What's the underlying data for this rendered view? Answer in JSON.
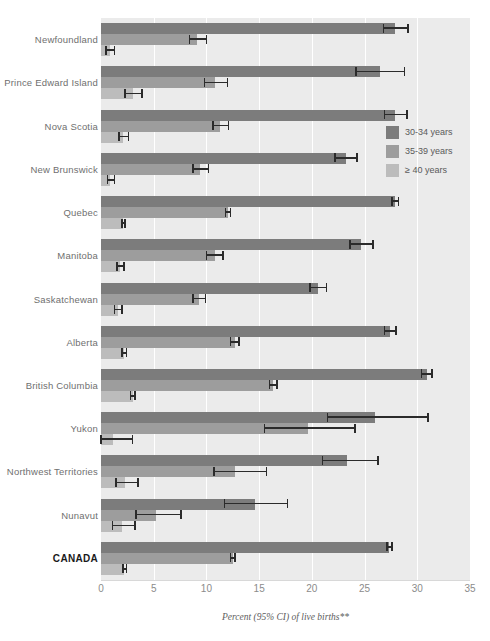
{
  "chart_data": {
    "type": "bar",
    "orientation": "horizontal",
    "title": "",
    "subtitle": "",
    "xlabel": "Percent (95% CI) of live births**",
    "ylabel": "",
    "xlim": [
      0,
      35
    ],
    "xticks": [
      0,
      5,
      10,
      15,
      20,
      25,
      30,
      35
    ],
    "xtick_labels": [
      "0",
      "5",
      "10",
      "15",
      "20",
      "25",
      "30",
      "35"
    ],
    "grid": true,
    "legend_position": "right",
    "categories": [
      "Newfoundland",
      "Prince Edward Island",
      "Nova Scotia",
      "New Brunswick",
      "Quebec",
      "Manitoba",
      "Saskatchewan",
      "Alberta",
      "British Columbia",
      "Yukon",
      "Northwest Territories",
      "Nunavut",
      "CANADA"
    ],
    "emphasized_category": "CANADA",
    "series": [
      {
        "name": "30-34 years",
        "color": "#7c7c7c",
        "values": [
          27.9,
          26.5,
          27.9,
          23.2,
          27.9,
          24.7,
          20.6,
          27.4,
          30.9,
          26.0,
          23.3,
          14.6,
          27.3
        ],
        "ci_low": [
          26.8,
          24.2,
          26.9,
          22.2,
          27.6,
          23.6,
          19.8,
          26.9,
          30.4,
          21.5,
          21.0,
          11.7,
          27.1
        ],
        "ci_high": [
          29.1,
          28.8,
          29.0,
          24.3,
          28.2,
          25.8,
          21.4,
          28.0,
          31.4,
          31.0,
          26.3,
          17.7,
          27.6
        ]
      },
      {
        "name": "35-39 years",
        "color": "#9d9d9d",
        "values": [
          9.1,
          10.8,
          11.3,
          9.4,
          12.0,
          10.8,
          9.3,
          12.7,
          16.3,
          19.6,
          12.7,
          5.2,
          12.5
        ],
        "ci_low": [
          8.4,
          9.8,
          10.6,
          8.7,
          11.8,
          10.0,
          8.7,
          12.3,
          16.0,
          15.5,
          10.7,
          3.3,
          12.3
        ],
        "ci_high": [
          10.0,
          12.0,
          12.1,
          10.2,
          12.3,
          11.6,
          9.9,
          13.1,
          16.7,
          24.1,
          15.7,
          7.6,
          12.7
        ]
      },
      {
        "name": "≥ 40 years",
        "color": "#bcbcbc",
        "values": [
          0.85,
          3.0,
          2.1,
          0.9,
          2.1,
          1.8,
          1.6,
          2.2,
          3.0,
          1.1,
          2.3,
          2.0,
          2.2
        ],
        "ci_low": [
          0.5,
          2.3,
          1.7,
          0.6,
          2.0,
          1.5,
          1.3,
          2.0,
          2.8,
          0.0,
          1.4,
          1.1,
          2.1
        ],
        "ci_high": [
          1.3,
          3.9,
          2.6,
          1.3,
          2.3,
          2.2,
          2.0,
          2.4,
          3.2,
          3.0,
          3.5,
          3.2,
          2.4
        ]
      }
    ]
  },
  "legend": {
    "items": [
      {
        "label": "30-34 years",
        "color": "#7c7c7c"
      },
      {
        "label": "35-39 years",
        "color": "#9d9d9d"
      },
      {
        "label": "≥ 40 years",
        "color": "#bcbcbc"
      }
    ]
  },
  "axis": {
    "x_title": "Percent (95% CI) of live births**"
  },
  "top_caption": ""
}
